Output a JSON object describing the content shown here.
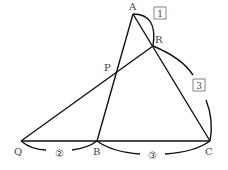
{
  "diagram": {
    "points": {
      "A": {
        "label": "A",
        "x": 133,
        "y": 14
      },
      "R": {
        "label": "R",
        "x": 153,
        "y": 46
      },
      "P": {
        "label": "P",
        "x": 115,
        "y": 72
      },
      "Q": {
        "label": "Q",
        "x": 21,
        "y": 141
      },
      "B": {
        "label": "B",
        "x": 97,
        "y": 141
      },
      "C": {
        "label": "C",
        "x": 210,
        "y": 141
      }
    },
    "ratios": {
      "AR": "1",
      "RC": "3",
      "QB": "②",
      "BC": "③"
    }
  }
}
